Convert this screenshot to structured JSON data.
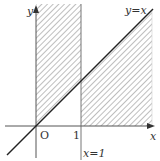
{
  "diagram": {
    "type": "coordinate-region",
    "axes": {
      "x_label": "x",
      "y_label": "y",
      "origin_label": "O"
    },
    "ticks": [
      {
        "value": 1,
        "label": "1"
      }
    ],
    "lines": [
      {
        "equation": "y=x",
        "label": "y=x"
      },
      {
        "equation": "x=1",
        "label": "x=1"
      }
    ],
    "shaded_region": {
      "pattern": "diagonal-hatch",
      "description": "0<x<1 above y=x; x>1 between x-axis and y=x"
    },
    "colors": {
      "axis": "#555555",
      "line": "#222222",
      "hatch": "#9a9a9a",
      "boundary": "#777777"
    }
  }
}
